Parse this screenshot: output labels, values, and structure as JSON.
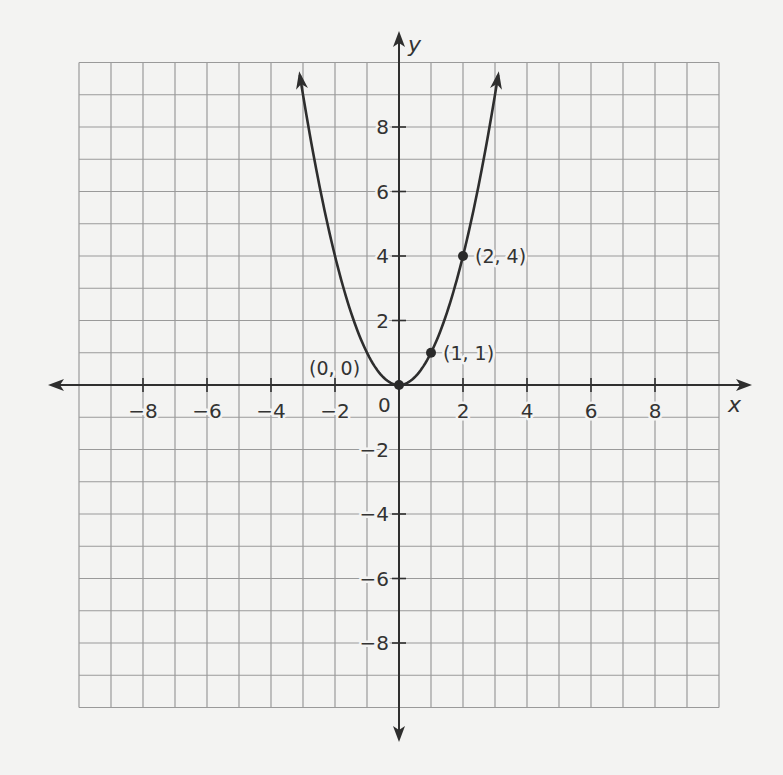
{
  "chart_data": {
    "type": "line",
    "title": "",
    "function": "y = x^2",
    "xlabel": "x",
    "ylabel": "y",
    "xlim": [
      -10,
      10
    ],
    "ylim": [
      -10,
      10
    ],
    "grid": true,
    "grid_step": 1,
    "x_ticks": [
      -8,
      -6,
      -4,
      -2,
      2,
      4,
      6,
      8
    ],
    "y_ticks": [
      8,
      6,
      4,
      2,
      -2,
      -4,
      -6,
      -8
    ],
    "origin_label": "0",
    "curve_domain": [
      -3.1,
      3.1
    ],
    "curve_arrows": "both-ends",
    "series": [
      {
        "name": "y = x^2",
        "x": [
          -3,
          -2,
          -1,
          0,
          1,
          2,
          3
        ],
        "y": [
          9,
          4,
          1,
          0,
          1,
          4,
          9
        ]
      }
    ],
    "highlighted_points": [
      {
        "x": 0,
        "y": 0,
        "label": "(0, 0)"
      },
      {
        "x": 1,
        "y": 1,
        "label": "(1, 1)"
      },
      {
        "x": 2,
        "y": 4,
        "label": "(2, 4)"
      }
    ],
    "legend": null
  },
  "axes": {
    "x_title": "x",
    "y_title": "y",
    "origin_label": "0"
  },
  "colors": {
    "background": "#f3f3f2",
    "grid": "#9a9a9a",
    "axis": "#2f2f2f",
    "curve": "#2e2e2e"
  }
}
